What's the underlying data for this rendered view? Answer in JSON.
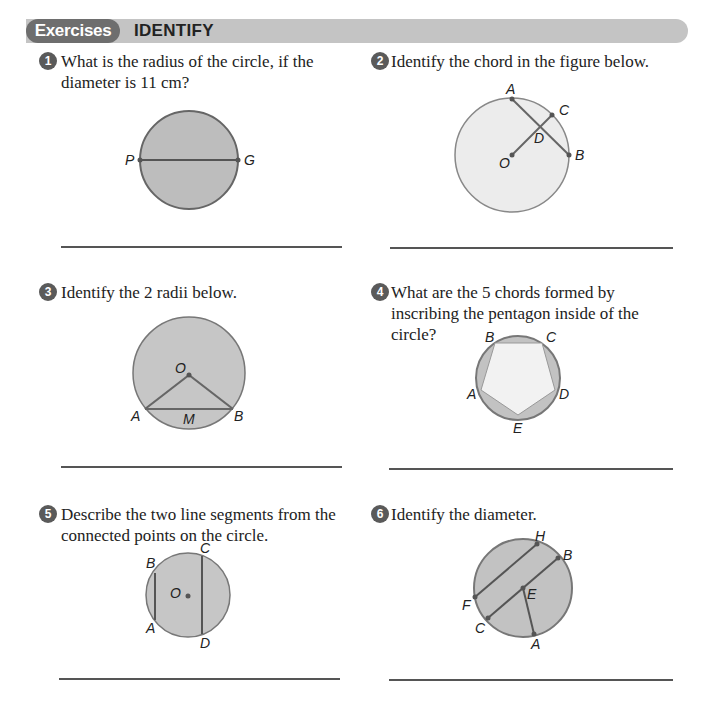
{
  "header": {
    "tab_label": "Exercises",
    "title": "IDENTIFY"
  },
  "exercises": [
    {
      "number": "1",
      "text": "What is the radius of the circle, if the diameter is 11 cm?",
      "labels": [
        "P",
        "G"
      ]
    },
    {
      "number": "2",
      "text": "Identify the chord in the figure below.",
      "labels": [
        "A",
        "C",
        "D",
        "O",
        "B"
      ]
    },
    {
      "number": "3",
      "text": "Identify the 2 radii below.",
      "labels": [
        "O",
        "A",
        "M",
        "B"
      ]
    },
    {
      "number": "4",
      "text": "What are the 5 chords formed by inscribing the pentagon inside of the circle?",
      "labels": [
        "B",
        "C",
        "A",
        "D",
        "E"
      ]
    },
    {
      "number": "5",
      "text": "Describe the two line segments from the connected points on the circle.",
      "labels": [
        "B",
        "C",
        "O",
        "A",
        "D"
      ]
    },
    {
      "number": "6",
      "text": "Identify the diameter.",
      "labels": [
        "H",
        "B",
        "F",
        "E",
        "C",
        "A"
      ]
    }
  ],
  "colors": {
    "header_tab": "#6e6e6e",
    "header_bar": "#c4c4c4",
    "circle_fill_dark": "#bdbdbd",
    "circle_fill_light": "#ececec",
    "stroke": "#666666"
  }
}
